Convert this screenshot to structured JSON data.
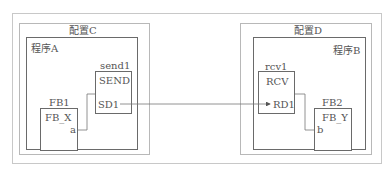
{
  "diagram": {
    "configs": [
      {
        "label": "配置C",
        "program": {
          "label": "程序A",
          "blocks": [
            {
              "instance": "send1",
              "type": "SEND",
              "port": "SD1"
            },
            {
              "instance": "FB1",
              "type": "FB_X",
              "port": "a"
            }
          ]
        }
      },
      {
        "label": "配置D",
        "program": {
          "label": "程序B",
          "blocks": [
            {
              "instance": "rcv1",
              "type": "RCV",
              "port": "RD1"
            },
            {
              "instance": "FB2",
              "type": "FB_Y",
              "port": "b"
            }
          ]
        }
      }
    ],
    "connections": [
      {
        "from": "FB1.a",
        "to": "send1"
      },
      {
        "from": "send1.SD1",
        "to": "rcv1.RD1"
      },
      {
        "from": "rcv1",
        "to": "FB2.b"
      }
    ],
    "colors": {
      "outer_frame": "#c8c8c8",
      "config_frame": "#b8b8b8",
      "program_frame": "#6a6a6a",
      "wire": "#777777"
    }
  }
}
